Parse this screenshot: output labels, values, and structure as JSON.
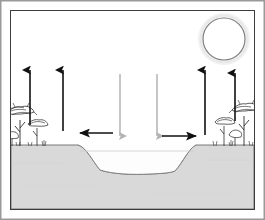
{
  "figure": {
    "title": "Savanna dry basin water balance diagram",
    "caption": "Cross-section of a dry lake depression in savanna woodland with evaporation, downward flux and lateral ground-level flow arrows beneath a sun.",
    "width": 265,
    "height": 220
  },
  "frame": {
    "outer_border_color": "#9a9a9a",
    "inner_border_color": "#3c3c3c",
    "background_color": "#ffffff"
  },
  "palette": {
    "sky": "#ffffff",
    "ground_fill": "#d9d9d9",
    "ground_outline": "#6b6b6b",
    "basin_fill": "#fdfdfd",
    "basin_outline": "#7a7a7a",
    "arrow_up": "#111111",
    "arrow_down": "#b3b3b3",
    "arrow_lateral": "#111111",
    "sun_outline": "#7d7d7d",
    "sun_glow": "#e8e8e8",
    "tree_color": "#2e2e2e"
  },
  "sun": {
    "label": "sun",
    "center_x": 224,
    "center_y": 39,
    "radius": 21,
    "glow_radius": 27,
    "fill": "#ffffff",
    "stroke": "#7d7d7d"
  },
  "ground": {
    "label": "ground-surface",
    "surface_y": 145,
    "basin_left_rim_x": 78,
    "basin_right_rim_x": 196,
    "basin_floor_y": 172,
    "basin_floor_left_x": 100,
    "basin_floor_right_x": 175,
    "bottom_y": 205
  },
  "basin": {
    "label": "dry-lake-depression",
    "state": "dry",
    "water_level_line_y": 151
  },
  "arrows": {
    "evaporation": {
      "label": "evaporation",
      "direction": "up",
      "color": "#111111",
      "count": 4,
      "items": [
        {
          "name": "evaporation-arrow-left-outer",
          "x": 30,
          "y_tail": 125,
          "y_head": 66
        },
        {
          "name": "evaporation-arrow-left-inner",
          "x": 63,
          "y_tail": 131,
          "y_head": 66
        },
        {
          "name": "evaporation-arrow-right-inner",
          "x": 205,
          "y_tail": 135,
          "y_head": 66
        },
        {
          "name": "evaporation-arrow-right-outer",
          "x": 235,
          "y_tail": 121,
          "y_head": 69
        }
      ]
    },
    "downward_flux": {
      "label": "downward-flux",
      "direction": "down",
      "color": "#b3b3b3",
      "count": 2,
      "items": [
        {
          "name": "downward-arrow-left",
          "x": 120,
          "y_tail": 74,
          "y_head": 139
        },
        {
          "name": "downward-arrow-right",
          "x": 157,
          "y_tail": 74,
          "y_head": 139
        }
      ]
    },
    "lateral_flow": {
      "label": "lateral-ground-flow",
      "color": "#111111",
      "count": 2,
      "items": [
        {
          "name": "lateral-arrow-left",
          "direction": "left",
          "y": 133,
          "x_tail": 113,
          "x_head": 76
        },
        {
          "name": "lateral-arrow-right",
          "direction": "right",
          "y": 136,
          "x_tail": 162,
          "x_head": 200
        }
      ]
    }
  },
  "vegetation": {
    "label": "savanna-woodland",
    "left_group": {
      "name": "tree-cluster-left",
      "x_range": [
        8,
        47
      ],
      "baseline_y": 146,
      "trees": [
        {
          "name": "acacia-tree-left-tall",
          "x": 20,
          "canopy_y": 112,
          "canopy_w": 26,
          "trunk_h": 32
        },
        {
          "name": "acacia-tree-left-mid",
          "x": 36,
          "canopy_y": 122,
          "canopy_w": 18,
          "trunk_h": 22
        },
        {
          "name": "shrub-left",
          "x": 11,
          "canopy_y": 134,
          "canopy_w": 11,
          "trunk_h": 10
        }
      ]
    },
    "right_group": {
      "name": "tree-cluster-right",
      "x_range": [
        213,
        256
      ],
      "baseline_y": 146,
      "trees": [
        {
          "name": "acacia-tree-right-tall",
          "x": 244,
          "canopy_y": 110,
          "canopy_w": 24,
          "trunk_h": 34
        },
        {
          "name": "acacia-tree-right-mid",
          "x": 224,
          "canopy_y": 122,
          "canopy_w": 18,
          "trunk_h": 22
        },
        {
          "name": "shrub-right",
          "x": 234,
          "canopy_y": 132,
          "canopy_w": 12,
          "trunk_h": 12
        }
      ]
    }
  }
}
